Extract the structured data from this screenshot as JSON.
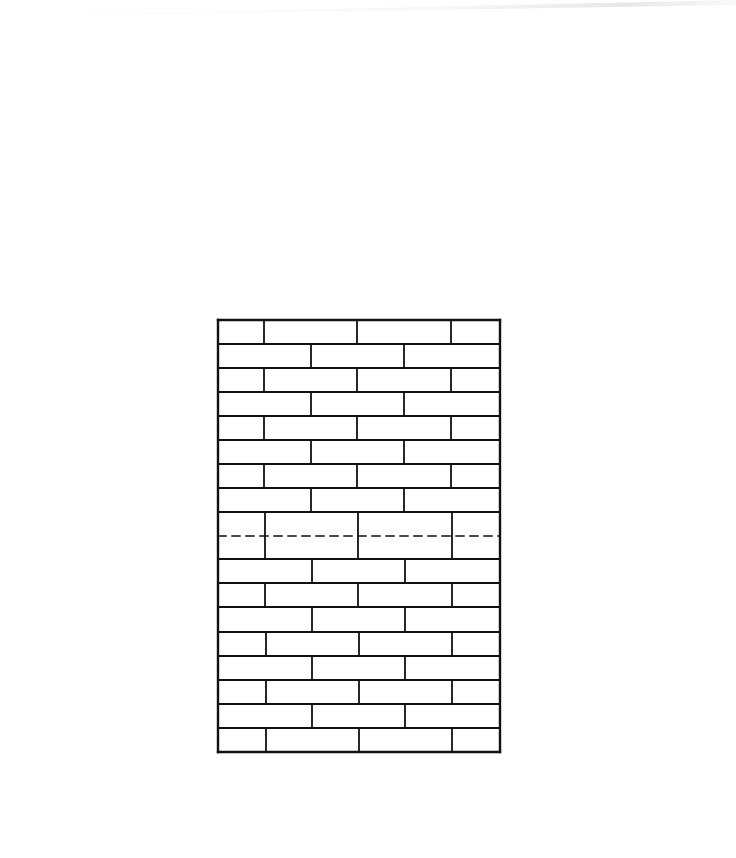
{
  "diagram": {
    "title": "",
    "type": "brick-wall-elevation",
    "stroke_color": "#111111",
    "background": "#ffffff",
    "frame": {
      "x": 218,
      "y": 320,
      "width": 282,
      "height": 432
    },
    "row_lines_y": [
      320,
      344,
      368,
      392,
      416,
      440,
      464,
      488,
      512,
      559,
      583,
      607,
      632,
      656,
      680,
      704,
      728,
      752
    ],
    "courses": [
      {
        "top": 320,
        "bottom": 344,
        "joints_x": [
          264,
          357,
          451
        ]
      },
      {
        "top": 344,
        "bottom": 368,
        "joints_x": [
          311,
          404
        ]
      },
      {
        "top": 368,
        "bottom": 392,
        "joints_x": [
          264,
          357,
          451
        ]
      },
      {
        "top": 392,
        "bottom": 416,
        "joints_x": [
          311,
          404
        ]
      },
      {
        "top": 416,
        "bottom": 440,
        "joints_x": [
          264,
          357,
          451
        ]
      },
      {
        "top": 440,
        "bottom": 464,
        "joints_x": [
          311,
          404
        ]
      },
      {
        "top": 464,
        "bottom": 488,
        "joints_x": [
          264,
          357,
          451
        ]
      },
      {
        "top": 488,
        "bottom": 512,
        "joints_x": [
          311,
          404
        ]
      },
      {
        "top": 512,
        "bottom": 559,
        "joints_x": [
          265,
          358,
          452
        ],
        "double_height": true
      },
      {
        "top": 559,
        "bottom": 583,
        "joints_x": [
          312,
          405
        ]
      },
      {
        "top": 583,
        "bottom": 607,
        "joints_x": [
          265,
          358,
          452
        ]
      },
      {
        "top": 607,
        "bottom": 632,
        "joints_x": [
          312,
          405
        ]
      },
      {
        "top": 632,
        "bottom": 656,
        "joints_x": [
          266,
          359,
          452
        ]
      },
      {
        "top": 656,
        "bottom": 680,
        "joints_x": [
          312,
          405
        ]
      },
      {
        "top": 680,
        "bottom": 704,
        "joints_x": [
          266,
          359,
          452
        ]
      },
      {
        "top": 704,
        "bottom": 728,
        "joints_x": [
          312,
          405
        ]
      },
      {
        "top": 728,
        "bottom": 752,
        "joints_x": [
          266,
          359,
          452
        ]
      }
    ],
    "dashed_line": {
      "y": 536,
      "x1": 218,
      "x2": 500,
      "label": ""
    }
  }
}
